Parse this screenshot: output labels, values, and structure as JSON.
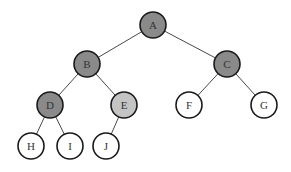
{
  "diagram": {
    "type": "binary-tree",
    "colors": {
      "dark_fill": "#8a8a8a",
      "light_fill": "#c4c4c4",
      "empty_fill": "#ffffff",
      "stroke": "#1a1a1a",
      "edge": "#333333"
    },
    "nodes": [
      {
        "id": "A",
        "label": "A",
        "x": 153,
        "y": 25,
        "fill": "dark"
      },
      {
        "id": "B",
        "label": "B",
        "x": 87,
        "y": 64,
        "fill": "dark"
      },
      {
        "id": "C",
        "label": "C",
        "x": 227,
        "y": 64,
        "fill": "dark"
      },
      {
        "id": "D",
        "label": "D",
        "x": 50,
        "y": 105,
        "fill": "dark"
      },
      {
        "id": "E",
        "label": "E",
        "x": 124,
        "y": 105,
        "fill": "light"
      },
      {
        "id": "F",
        "label": "F",
        "x": 189,
        "y": 105,
        "fill": "empty"
      },
      {
        "id": "G",
        "label": "G",
        "x": 264,
        "y": 105,
        "fill": "empty"
      },
      {
        "id": "H",
        "label": "H",
        "x": 31,
        "y": 146,
        "fill": "empty"
      },
      {
        "id": "I",
        "label": "I",
        "x": 70,
        "y": 146,
        "fill": "empty"
      },
      {
        "id": "J",
        "label": "J",
        "x": 106,
        "y": 146,
        "fill": "empty"
      }
    ],
    "edges": [
      [
        "A",
        "B"
      ],
      [
        "A",
        "C"
      ],
      [
        "B",
        "D"
      ],
      [
        "B",
        "E"
      ],
      [
        "C",
        "F"
      ],
      [
        "C",
        "G"
      ],
      [
        "D",
        "H"
      ],
      [
        "D",
        "I"
      ],
      [
        "E",
        "J"
      ]
    ]
  }
}
